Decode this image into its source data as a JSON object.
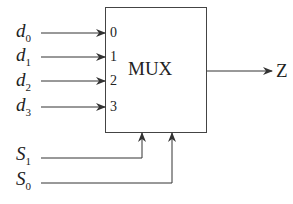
{
  "diagram": {
    "block_label": "MUX",
    "output_label": "Z",
    "inputs": [
      {
        "name": "d",
        "sub": "0",
        "port": "0"
      },
      {
        "name": "d",
        "sub": "1",
        "port": "1"
      },
      {
        "name": "d",
        "sub": "2",
        "port": "2"
      },
      {
        "name": "d",
        "sub": "3",
        "port": "3"
      }
    ],
    "selects": [
      {
        "name": "S",
        "sub": "1"
      },
      {
        "name": "S",
        "sub": "0"
      }
    ],
    "colors": {
      "line": "#333333",
      "background": "#ffffff"
    }
  }
}
